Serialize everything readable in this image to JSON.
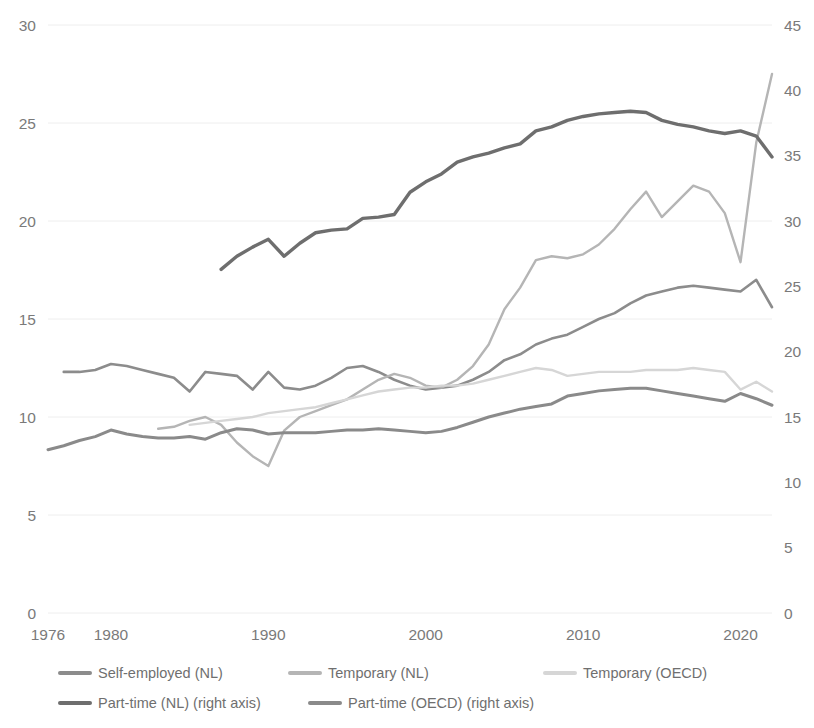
{
  "chart_data": {
    "type": "line",
    "title": "",
    "xlabel": "",
    "ylabel": "",
    "y2label": "",
    "grid": true,
    "legend_position": "bottom",
    "xlim": [
      1976,
      2022
    ],
    "ylim": [
      0,
      30
    ],
    "y2lim": [
      0,
      45
    ],
    "xticks": [
      1976,
      1980,
      1990,
      2000,
      2010,
      2020
    ],
    "yticks": [
      0,
      5,
      10,
      15,
      20,
      25,
      30
    ],
    "y2ticks": [
      0,
      5,
      10,
      15,
      20,
      25,
      30,
      35,
      40,
      45
    ],
    "axis_note_right": "right axis",
    "series": [
      {
        "name": "Self-employed (NL)",
        "axis": "left",
        "color": "#8c8c8c",
        "width": 2.6,
        "x": [
          1977,
          1978,
          1979,
          1980,
          1981,
          1982,
          1983,
          1984,
          1985,
          1986,
          1987,
          1988,
          1989,
          1990,
          1991,
          1992,
          1993,
          1994,
          1995,
          1996,
          1997,
          1998,
          1999,
          2000,
          2001,
          2002,
          2003,
          2004,
          2005,
          2006,
          2007,
          2008,
          2009,
          2010,
          2011,
          2012,
          2013,
          2014,
          2015,
          2016,
          2017,
          2018,
          2019,
          2020,
          2021,
          2022
        ],
        "values": [
          12.3,
          12.3,
          12.4,
          12.7,
          12.6,
          12.4,
          12.2,
          12.0,
          11.3,
          12.3,
          12.2,
          12.1,
          11.4,
          12.3,
          11.5,
          11.4,
          11.6,
          12.0,
          12.5,
          12.6,
          12.3,
          11.9,
          11.6,
          11.4,
          11.5,
          11.6,
          11.9,
          12.3,
          12.9,
          13.2,
          13.7,
          14.0,
          14.2,
          14.6,
          15.0,
          15.3,
          15.8,
          16.2,
          16.4,
          16.6,
          16.7,
          16.6,
          16.5,
          16.4,
          17.0,
          15.6
        ]
      },
      {
        "name": "Temporary (NL)",
        "axis": "left",
        "color": "#b5b5b5",
        "width": 2.4,
        "x": [
          1983,
          1984,
          1985,
          1986,
          1987,
          1988,
          1989,
          1990,
          1991,
          1992,
          1993,
          1994,
          1995,
          1996,
          1997,
          1998,
          1999,
          2000,
          2001,
          2002,
          2003,
          2004,
          2005,
          2006,
          2007,
          2008,
          2009,
          2010,
          2011,
          2012,
          2013,
          2014,
          2015,
          2016,
          2017,
          2018,
          2019,
          2020,
          2021,
          2022
        ],
        "values": [
          9.4,
          9.5,
          9.8,
          10.0,
          9.6,
          8.7,
          8.0,
          7.5,
          9.3,
          10.0,
          10.3,
          10.6,
          10.9,
          11.4,
          11.9,
          12.2,
          12.0,
          11.6,
          11.5,
          11.9,
          12.6,
          13.7,
          15.5,
          16.6,
          18.0,
          18.2,
          18.1,
          18.3,
          18.8,
          19.6,
          20.6,
          21.5,
          20.2,
          21.0,
          21.8,
          21.5,
          20.4,
          17.9,
          24.0,
          27.5
        ]
      },
      {
        "name": "Temporary (OECD)",
        "axis": "left",
        "color": "#d6d6d6",
        "width": 2.4,
        "x": [
          1985,
          1986,
          1987,
          1988,
          1989,
          1990,
          1991,
          1992,
          1993,
          1994,
          1995,
          1996,
          1997,
          1998,
          1999,
          2000,
          2001,
          2002,
          2003,
          2004,
          2005,
          2006,
          2007,
          2008,
          2009,
          2010,
          2011,
          2012,
          2013,
          2014,
          2015,
          2016,
          2017,
          2018,
          2019,
          2020,
          2021,
          2022
        ],
        "values": [
          9.6,
          9.7,
          9.8,
          9.9,
          10.0,
          10.2,
          10.3,
          10.4,
          10.5,
          10.7,
          10.9,
          11.1,
          11.3,
          11.4,
          11.5,
          11.5,
          11.6,
          11.6,
          11.7,
          11.9,
          12.1,
          12.3,
          12.5,
          12.4,
          12.1,
          12.2,
          12.3,
          12.3,
          12.3,
          12.4,
          12.4,
          12.4,
          12.5,
          12.4,
          12.3,
          11.4,
          11.8,
          11.3
        ]
      },
      {
        "name": "Part-time (NL) (right axis)",
        "axis": "right",
        "color": "#6e6e6e",
        "width": 3.4,
        "x": [
          1987,
          1988,
          1989,
          1990,
          1991,
          1992,
          1993,
          1994,
          1995,
          1996,
          1997,
          1998,
          1999,
          2000,
          2001,
          2002,
          2003,
          2004,
          2005,
          2006,
          2007,
          2008,
          2009,
          2010,
          2011,
          2012,
          2013,
          2014,
          2015,
          2016,
          2017,
          2018,
          2019,
          2020,
          2021,
          2022
        ],
        "values": [
          26.3,
          27.3,
          28.0,
          28.6,
          27.3,
          28.3,
          29.1,
          29.3,
          29.4,
          30.2,
          30.3,
          30.5,
          32.2,
          33.0,
          33.6,
          34.5,
          34.9,
          35.2,
          35.6,
          35.9,
          36.9,
          37.2,
          37.7,
          38.0,
          38.2,
          38.3,
          38.4,
          38.3,
          37.7,
          37.4,
          37.2,
          36.9,
          36.7,
          36.9,
          36.5,
          34.9
        ]
      },
      {
        "name": "Part-time (OECD) (right axis)",
        "axis": "right",
        "color": "#8a8a8a",
        "width": 3.0,
        "x": [
          1976,
          1977,
          1978,
          1979,
          1980,
          1981,
          1982,
          1983,
          1984,
          1985,
          1986,
          1987,
          1988,
          1989,
          1990,
          1991,
          1992,
          1993,
          1994,
          1995,
          1996,
          1997,
          1998,
          1999,
          2000,
          2001,
          2002,
          2003,
          2004,
          2005,
          2006,
          2007,
          2008,
          2009,
          2010,
          2011,
          2012,
          2013,
          2014,
          2015,
          2016,
          2017,
          2018,
          2019,
          2020,
          2021,
          2022
        ],
        "values": [
          12.5,
          12.8,
          13.2,
          13.5,
          14.0,
          13.7,
          13.5,
          13.4,
          13.4,
          13.5,
          13.3,
          13.8,
          14.1,
          14.0,
          13.7,
          13.8,
          13.8,
          13.8,
          13.9,
          14.0,
          14.0,
          14.1,
          14.0,
          13.9,
          13.8,
          13.9,
          14.2,
          14.6,
          15.0,
          15.3,
          15.6,
          15.8,
          16.0,
          16.6,
          16.8,
          17.0,
          17.1,
          17.2,
          17.2,
          17.0,
          16.8,
          16.6,
          16.4,
          16.2,
          16.8,
          16.4,
          15.9
        ]
      }
    ]
  },
  "legend": {
    "items": [
      {
        "label": "Self-employed (NL)",
        "color": "#8c8c8c"
      },
      {
        "label": "Temporary (NL)",
        "color": "#b5b5b5"
      },
      {
        "label": "Temporary (OECD)",
        "color": "#d6d6d6"
      },
      {
        "label": "Part-time (NL) (right axis)",
        "color": "#6e6e6e"
      },
      {
        "label": "Part-time (OECD) (right axis)",
        "color": "#8a8a8a"
      }
    ]
  },
  "axes": {
    "left_ticks": [
      "30",
      "25",
      "20",
      "15",
      "10",
      "5",
      "0"
    ],
    "right_ticks": [
      "45",
      "40",
      "35",
      "30",
      "25",
      "20",
      "15",
      "10",
      "5",
      "0"
    ],
    "x_ticks": [
      "1976",
      "1980",
      "1990",
      "2000",
      "2010",
      "2020"
    ]
  }
}
